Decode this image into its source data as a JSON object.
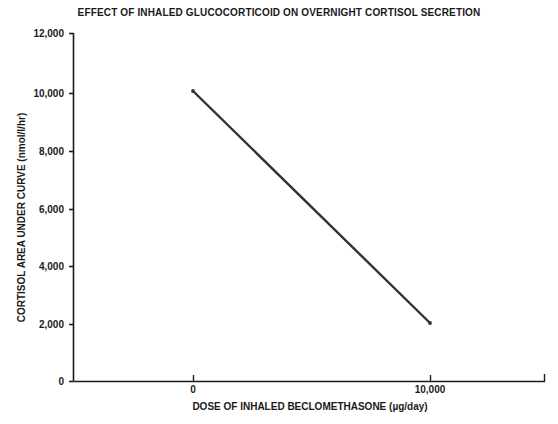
{
  "chart_data": {
    "type": "line",
    "title": "EFFECT OF INHALED GLUCOCORTICOID ON OVERNIGHT CORTISOL SECRETION",
    "xlabel": "DOSE OF INHALED BECLOMETHASONE (µg/day)",
    "ylabel": "CORTISOL AREA UNDER CURVE (nmol/l/hr)",
    "x": [
      0,
      10000
    ],
    "series": [
      {
        "name": "cortisol-auc",
        "values": [
          10000,
          2000
        ],
        "color": "#333333"
      }
    ],
    "xlim": [
      -2000,
      15000
    ],
    "ylim": [
      0,
      12000
    ],
    "x_ticks": [
      0,
      10000
    ],
    "x_tick_labels": [
      "0",
      "10,000"
    ],
    "y_ticks": [
      0,
      2000,
      4000,
      6000,
      8000,
      10000,
      12000
    ],
    "y_tick_labels": [
      "0",
      "2,000",
      "4,000",
      "6,000",
      "8,000",
      "10,000",
      "12,000"
    ],
    "grid": false,
    "legend": false,
    "axis_color": "#1a1a1a",
    "background": "#ffffff"
  },
  "ticks": {
    "y": [
      {
        "label": "12,000",
        "top": 33
      },
      {
        "label": "10,000",
        "top": 93
      },
      {
        "label": "8,000",
        "top": 151
      },
      {
        "label": "6,000",
        "top": 209
      },
      {
        "label": "4,000",
        "top": 266
      },
      {
        "label": "2,000",
        "top": 324
      },
      {
        "label": "0",
        "top": 381
      }
    ],
    "x": [
      {
        "label": "0",
        "left": 193
      },
      {
        "label": "10,000",
        "left": 430
      }
    ]
  }
}
